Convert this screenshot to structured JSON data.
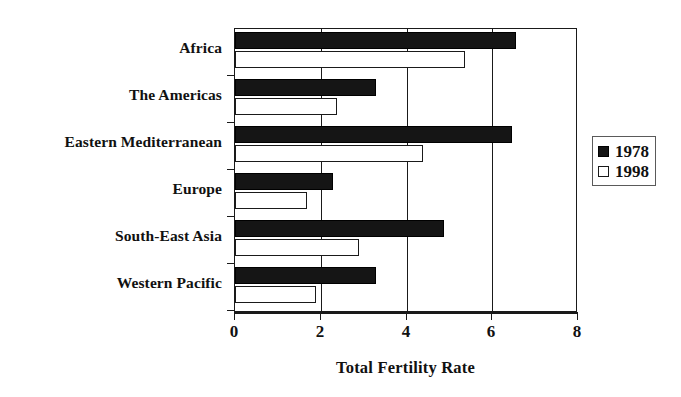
{
  "chart_data": {
    "type": "bar",
    "orientation": "horizontal",
    "title": "",
    "xlabel": "Total Fertility Rate",
    "ylabel": "",
    "xlim": [
      0,
      8
    ],
    "xticks": [
      0,
      2,
      4,
      6,
      8
    ],
    "grid": true,
    "legend_position": "right",
    "categories": [
      "Africa",
      "The Americas",
      "Eastern Mediterranean",
      "Europe",
      "South-East Asia",
      "Western Pacific"
    ],
    "series": [
      {
        "name": "1978",
        "color": "#151515",
        "values": [
          6.6,
          3.3,
          6.5,
          2.3,
          4.9,
          3.3
        ]
      },
      {
        "name": "1998",
        "color": "#ffffff",
        "values": [
          5.4,
          2.4,
          4.4,
          1.7,
          2.9,
          1.9
        ]
      }
    ]
  },
  "axis": {
    "x_tick_labels": [
      "0",
      "2",
      "4",
      "6",
      "8"
    ],
    "x_title": "Total Fertility Rate"
  },
  "legend": {
    "items": [
      {
        "label": "1978",
        "swatch": "filled-square-icon"
      },
      {
        "label": "1998",
        "swatch": "hollow-square-icon"
      }
    ]
  }
}
